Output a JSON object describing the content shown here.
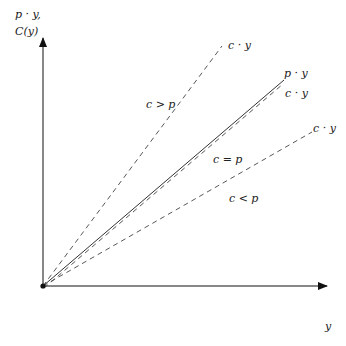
{
  "axes": {
    "y_label_line1": "p · y,",
    "y_label_line2": "C(y)",
    "x_label": "y",
    "color": "#111111"
  },
  "lines": [
    {
      "id": "revenue",
      "style": "solid",
      "end_label": "p · y",
      "region_label": ""
    },
    {
      "id": "cost-high",
      "style": "dashed",
      "end_label": "c · y",
      "region_label": "c > p"
    },
    {
      "id": "cost-equal",
      "style": "dashed",
      "end_label": "c · y",
      "region_label": "c = p"
    },
    {
      "id": "cost-low",
      "style": "dashed",
      "end_label": "c · y",
      "region_label": "c < p"
    }
  ],
  "colors": {
    "line": "#333333",
    "dashed": "#444444",
    "text": "#222222",
    "background": "#ffffff"
  }
}
